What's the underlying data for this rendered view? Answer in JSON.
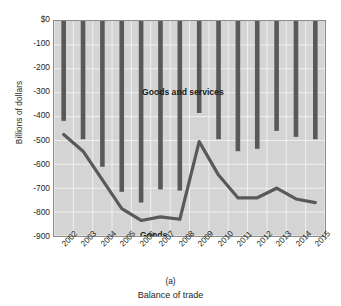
{
  "figure": {
    "caption_label": "(a)",
    "caption_title": "Balance of trade",
    "y_axis_title": "Billions of dollars"
  },
  "chart_data": {
    "type": "bar",
    "title": "Balance of trade",
    "subtitle": "(a)",
    "xlabel": "",
    "ylabel": "Billions of dollars",
    "ylim": [
      -900,
      0
    ],
    "yticks": [
      0,
      -100,
      -200,
      -300,
      -400,
      -500,
      -600,
      -700,
      -800,
      -900
    ],
    "ytick_labels": [
      "$0",
      "-100",
      "-200",
      "-300",
      "-400",
      "-500",
      "-600",
      "-700",
      "-800",
      "-900"
    ],
    "categories": [
      "2002",
      "2003",
      "2004",
      "2005",
      "2006",
      "2007",
      "2008",
      "2009",
      "2010",
      "2011",
      "2012",
      "2013",
      "2014",
      "2015"
    ],
    "grid": true,
    "legend_position": "in-plot annotations",
    "series": [
      {
        "name": "Goods and services",
        "render": "bar",
        "color": "#595959",
        "values": [
          -418,
          -495,
          -610,
          -715,
          -760,
          -705,
          -710,
          -385,
          -495,
          -545,
          -535,
          -460,
          -485,
          -495
        ]
      },
      {
        "name": "Goods",
        "render": "line",
        "color": "#595959",
        "values": [
          -475,
          -545,
          -665,
          -785,
          -835,
          -820,
          -830,
          -505,
          -645,
          -740,
          -740,
          -700,
          -745,
          -760
        ]
      }
    ],
    "annotations": [
      {
        "text": "Goods and services",
        "x": "2004",
        "y": -220
      },
      {
        "text": "Goods",
        "x": "2004",
        "y": -800
      }
    ]
  }
}
